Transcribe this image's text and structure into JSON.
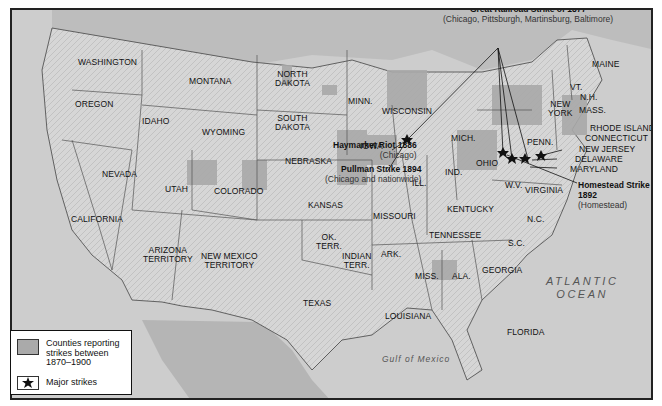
{
  "map": {
    "oceans": {
      "pacific": "PACIFIC\nOCEAN",
      "pacific_line1": "PACIFIC",
      "pacific_line2": "OCEAN",
      "atlantic_line1": "ATLANTIC",
      "atlantic_line2": "OCEAN",
      "gulf": "Gulf of Mexico"
    },
    "states": {
      "washington": "WASHINGTON",
      "oregon": "OREGON",
      "california": "CALIFORNIA",
      "nevada": "NEVADA",
      "idaho": "IDAHO",
      "montana": "MONTANA",
      "wyoming": "WYOMING",
      "utah": "UTAH",
      "colorado": "COLORADO",
      "arizona_1": "ARIZONA",
      "arizona_2": "TERRITORY",
      "newmexico_1": "NEW MEXICO",
      "newmexico_2": "TERRITORY",
      "northdakota_1": "NORTH",
      "northdakota_2": "DAKOTA",
      "southdakota_1": "SOUTH",
      "southdakota_2": "DAKOTA",
      "nebraska": "NEBRASKA",
      "kansas": "KANSAS",
      "okterr_1": "OK.",
      "okterr_2": "TERR.",
      "indianterr_1": "INDIAN",
      "indianterr_2": "TERR.",
      "texas": "TEXAS",
      "minn": "MINN.",
      "iowa": "IOWA",
      "missouri": "MISSOURI",
      "ark": "ARK.",
      "louisiana": "LOUISIANA",
      "wisconsin": "WISCONSIN",
      "ill": "ILL.",
      "mich": "MICH.",
      "ind": "IND.",
      "ohio": "OHIO",
      "kentucky": "KENTUCKY",
      "tennessee": "TENNESSEE",
      "miss": "MISS.",
      "ala": "ALA.",
      "georgia": "GEORGIA",
      "florida": "FLORIDA",
      "sc": "S.C.",
      "nc": "N.C.",
      "virginia": "VIRGINIA",
      "wv": "W.V.",
      "penn": "PENN.",
      "newyork_1": "NEW",
      "newyork_2": "YORK",
      "maine": "MAINE",
      "vt": "VT.",
      "nh": "N.H.",
      "mass": "MASS.",
      "rhodeisland": "RHODE ISLAND",
      "connecticut": "CONNECTICUT",
      "newjersey": "NEW JERSEY",
      "delaware": "DELAWARE",
      "maryland": "MARYLAND"
    },
    "events": [
      {
        "title": "Great Railroad Strike of 1877",
        "sub": "(Chicago, Pittsburgh, Martinsburg, Baltimore)"
      },
      {
        "title": "Haymarket Riot 1886",
        "sub": "(Chicago)"
      },
      {
        "title": "Pullman Strike 1894",
        "sub": "(Chicago and nationwide)"
      },
      {
        "title": "Homestead Strike",
        "title2": "1892",
        "sub": "(Homestead)"
      }
    ],
    "colors": {
      "land": "#d9d9d9",
      "water": "#cfcfcf",
      "strike_counties": "#a8a8a8",
      "border": "#222222"
    }
  },
  "legend": {
    "items": [
      {
        "label_1": "Counties reporting",
        "label_2": "strikes between",
        "label_3": "1870–1900",
        "icon": "gray-swatch"
      },
      {
        "label_1": "Major strikes",
        "icon": "strike-star-icon"
      }
    ]
  }
}
